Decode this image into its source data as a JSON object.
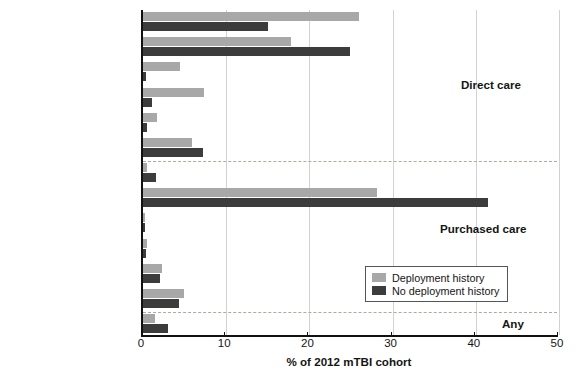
{
  "chart_data": {
    "type": "bar",
    "orientation": "horizontal",
    "title": "",
    "xlabel": "% of 2012 mTBI cohort",
    "ylabel": "",
    "xlim": [
      0,
      50
    ],
    "xticks": [
      0,
      10,
      20,
      30,
      40,
      50
    ],
    "grid": true,
    "legend_position": "center-right",
    "series": [
      {
        "name": "Deployment history",
        "color": "#a8a8a8"
      },
      {
        "name": "No deployment history",
        "color": "#3c3c3c"
      }
    ],
    "sections": [
      {
        "note": "Direct care"
      },
      {
        "note": "Purchased care"
      },
      {
        "note": "Any"
      }
    ],
    "categories": [
      "Primary care**",
      "Emergency department**",
      "Behavioral health**",
      "Neurology**",
      "Inpatient**",
      "Other**",
      "Primary care",
      "Emergency department**",
      "Behavioral health*",
      "Neurology**",
      "Inpatient",
      "Other",
      "Other**"
    ],
    "rows": [
      {
        "category": "Primary care**",
        "section": "Direct care",
        "deployment_history": 26.0,
        "no_deployment_history": 15.0
      },
      {
        "category": "Emergency department**",
        "section": "Direct care",
        "deployment_history": 17.8,
        "no_deployment_history": 24.9
      },
      {
        "category": "Behavioral health**",
        "section": "Direct care",
        "deployment_history": 4.4,
        "no_deployment_history": 0.4
      },
      {
        "category": "Neurology**",
        "section": "Direct care",
        "deployment_history": 7.3,
        "no_deployment_history": 1.1
      },
      {
        "category": "Inpatient**",
        "section": "Direct care",
        "deployment_history": 1.7,
        "no_deployment_history": 0.5
      },
      {
        "category": "Other**",
        "section": "Direct care",
        "deployment_history": 5.9,
        "no_deployment_history": 7.2
      },
      {
        "category": "Primary care",
        "section": "Purchased care",
        "deployment_history": 0.5,
        "no_deployment_history": 1.6
      },
      {
        "category": "Emergency department**",
        "section": "Purchased care",
        "deployment_history": 28.1,
        "no_deployment_history": 41.5
      },
      {
        "category": "Behavioral health*",
        "section": "Purchased care",
        "deployment_history": 0.3,
        "no_deployment_history": 0.1
      },
      {
        "category": "Neurology**",
        "section": "Purchased care",
        "deployment_history": 0.5,
        "no_deployment_history": 0.4
      },
      {
        "category": "Inpatient",
        "section": "Purchased care",
        "deployment_history": 2.3,
        "no_deployment_history": 2.1
      },
      {
        "category": "Other",
        "section": "Purchased care",
        "deployment_history": 4.9,
        "no_deployment_history": 4.3
      },
      {
        "category": "Other**",
        "section": "Any",
        "deployment_history": 1.5,
        "no_deployment_history": 3.0
      }
    ]
  },
  "legend": {
    "items": [
      {
        "label": "Deployment history",
        "swatch": "light"
      },
      {
        "label": "No deployment history",
        "swatch": "dark"
      }
    ]
  },
  "annotations": {
    "direct_care": "Direct care",
    "purchased_care": "Purchased care",
    "any": "Any"
  },
  "axis": {
    "x_label": "% of 2012 mTBI cohort",
    "x_ticks": [
      "0",
      "10",
      "20",
      "30",
      "40",
      "50"
    ]
  }
}
